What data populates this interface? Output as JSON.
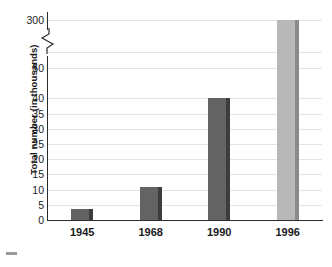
{
  "chart_data": {
    "type": "bar",
    "title": "",
    "xlabel": "",
    "ylabel": "Total number (in thousands)",
    "categories": [
      "1945",
      "1968",
      "1990",
      "1996"
    ],
    "values": [
      3.5,
      11,
      40,
      300
    ],
    "series": [
      {
        "name": "Total number",
        "values": [
          3.5,
          11,
          40,
          300
        ]
      }
    ],
    "ytick_labels": [
      "0",
      "5",
      "10",
      "15",
      "20",
      "25",
      "30",
      "35",
      "40",
      "50",
      "300"
    ],
    "ytick_values": [
      0,
      5,
      10,
      15,
      20,
      25,
      30,
      35,
      40,
      50,
      300
    ],
    "axis_break": {
      "present": true,
      "between": [
        50,
        300
      ],
      "symbol": "zigzag"
    },
    "ylim": [
      0,
      300
    ],
    "grid": true,
    "legend": "none",
    "bar_colors": [
      "#636363",
      "#636363",
      "#636363",
      "#b8b8b8"
    ],
    "bar_edge_colors": [
      "#3d3d3d",
      "#3d3d3d",
      "#3d3d3d",
      "#8a8a8a"
    ],
    "gridline_color": "#e4e4e4",
    "axis_color": "#2b2b2b",
    "background_color": "#ffffff",
    "annotations": []
  },
  "axis": {
    "y_title": "Total number (in thousands)"
  },
  "ticks": {
    "y": [
      {
        "label": "300"
      },
      {
        "label": "50"
      },
      {
        "label": "40"
      },
      {
        "label": "35"
      },
      {
        "label": "30"
      },
      {
        "label": "25"
      },
      {
        "label": "20"
      },
      {
        "label": "15"
      },
      {
        "label": "10"
      },
      {
        "label": "5"
      },
      {
        "label": "0"
      }
    ],
    "x": [
      {
        "label": "1945"
      },
      {
        "label": "1968"
      },
      {
        "label": "1990"
      },
      {
        "label": "1996"
      }
    ]
  }
}
